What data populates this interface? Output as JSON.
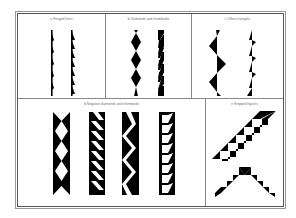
{
  "figure": {
    "panels": [
      {
        "id": "a",
        "label": "a  Fringed lines"
      },
      {
        "id": "b",
        "label": "b  Diamonds and rhomboids"
      },
      {
        "id": "c",
        "label": "c  Offset triangles"
      },
      {
        "id": "d",
        "label": "d  Negative diamonds and rhomboids"
      },
      {
        "id": "e",
        "label": "e  Stepped figures"
      }
    ],
    "colors": {
      "ink": "#000000",
      "frame": "#555555",
      "paper": "#ffffff"
    }
  }
}
